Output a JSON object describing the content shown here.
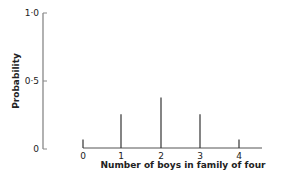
{
  "chart_data": {
    "type": "bar",
    "title": "",
    "xlabel": "Number of boys in family of four",
    "ylabel": "Probability",
    "categories": [
      "0",
      "1",
      "2",
      "3",
      "4"
    ],
    "values": [
      0.0625,
      0.25,
      0.375,
      0.25,
      0.0625
    ],
    "ylim": [
      0,
      1.0
    ],
    "yticks": [
      "0",
      "0·5",
      "1·0"
    ],
    "grid": false,
    "legend": null
  }
}
